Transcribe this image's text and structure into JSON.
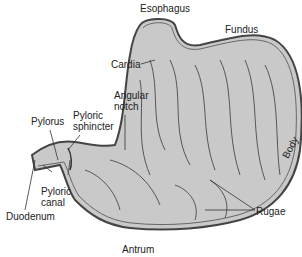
{
  "diagram": {
    "labels": {
      "esophagus": "Esophagus",
      "fundus": "Fundus",
      "cardia": "Cardia",
      "angular_notch_1": "Angular",
      "angular_notch_2": "notch",
      "pylorus": "Pylorus",
      "pyloric_sphincter_1": "Pyloric",
      "pyloric_sphincter_2": "sphincter",
      "pyloric_canal_1": "Pyloric",
      "pyloric_canal_2": "canal",
      "duodenum": "Duodenum",
      "antrum": "Antrum",
      "rugae": "Rugae",
      "body": "Body"
    },
    "colors": {
      "fill": "#c9c9c9",
      "outline": "#444444",
      "text": "#222222"
    }
  }
}
